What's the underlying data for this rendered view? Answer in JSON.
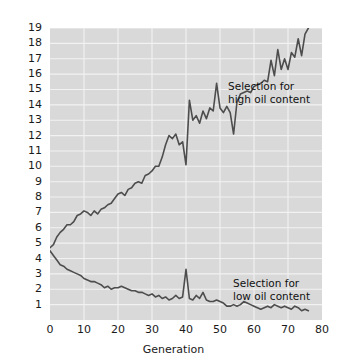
{
  "chart_data": {
    "type": "line",
    "title": "",
    "subtitle": "",
    "xlabel": "Generation",
    "ylabel": "Percentage of oil content",
    "xlim": [
      0,
      80
    ],
    "ylim": [
      0,
      19
    ],
    "xticks": [
      0,
      10,
      20,
      30,
      40,
      50,
      60,
      70,
      80
    ],
    "yticks": [
      1,
      2,
      3,
      4,
      5,
      6,
      7,
      8,
      9,
      10,
      11,
      12,
      13,
      14,
      15,
      16,
      17,
      18,
      19
    ],
    "grid": true,
    "grid_color": "#f2f2f2",
    "plot_background": "#d9d9d9",
    "line_color": "#4d4d4d",
    "legend": "none",
    "annotations": [
      {
        "name": "high-selection-label",
        "text": "Selection for\nhigh oil content",
        "x": 48,
        "y": 17.2
      },
      {
        "name": "low-selection-label",
        "text": "Selection for\nlow oil content",
        "x": 49,
        "y": 4.2
      }
    ],
    "series": [
      {
        "name": "Selection for high oil content",
        "color": "#4d4d4d",
        "x": [
          0,
          1,
          2,
          3,
          4,
          5,
          6,
          7,
          8,
          9,
          10,
          11,
          12,
          13,
          14,
          15,
          16,
          17,
          18,
          19,
          20,
          21,
          22,
          23,
          24,
          25,
          26,
          27,
          28,
          29,
          30,
          31,
          32,
          33,
          34,
          35,
          36,
          37,
          38,
          39,
          40,
          41,
          42,
          43,
          44,
          45,
          46,
          47,
          48,
          49,
          50,
          51,
          52,
          53,
          54,
          55,
          56,
          57,
          58,
          59,
          60,
          61,
          62,
          63,
          64,
          65,
          66,
          67,
          68,
          69,
          70,
          71,
          72,
          73,
          74,
          75,
          76
        ],
        "values": [
          4.7,
          4.9,
          5.4,
          5.7,
          5.9,
          6.2,
          6.2,
          6.4,
          6.8,
          6.9,
          7.1,
          7.0,
          6.8,
          7.1,
          6.9,
          7.2,
          7.3,
          7.5,
          7.6,
          7.9,
          8.2,
          8.3,
          8.1,
          8.5,
          8.6,
          8.9,
          9.0,
          8.9,
          9.4,
          9.5,
          9.7,
          10.0,
          10.0,
          10.6,
          11.4,
          12.0,
          11.8,
          12.1,
          11.4,
          11.6,
          10.1,
          14.3,
          13.0,
          13.3,
          12.8,
          13.6,
          13.1,
          13.8,
          13.6,
          15.4,
          13.8,
          13.5,
          13.9,
          13.5,
          12.1,
          14.2,
          14.7,
          14.8,
          14.9,
          14.8,
          15.2,
          15.3,
          15.4,
          15.6,
          15.5,
          16.9,
          15.9,
          17.6,
          16.3,
          17.0,
          16.3,
          17.4,
          17.1,
          18.3,
          17.2,
          18.6,
          19.0
        ]
      },
      {
        "name": "Selection for low oil content",
        "color": "#4d4d4d",
        "x": [
          0,
          1,
          2,
          3,
          4,
          5,
          6,
          7,
          8,
          9,
          10,
          11,
          12,
          13,
          14,
          15,
          16,
          17,
          18,
          19,
          20,
          21,
          22,
          23,
          24,
          25,
          26,
          27,
          28,
          29,
          30,
          31,
          32,
          33,
          34,
          35,
          36,
          37,
          38,
          39,
          40,
          41,
          42,
          43,
          44,
          45,
          46,
          47,
          48,
          49,
          50,
          51,
          52,
          53,
          54,
          55,
          56,
          57,
          58,
          59,
          60,
          61,
          62,
          63,
          64,
          65,
          66,
          67,
          68,
          69,
          70,
          71,
          72,
          73,
          74,
          75,
          76
        ],
        "values": [
          4.5,
          4.2,
          3.9,
          3.6,
          3.5,
          3.3,
          3.2,
          3.1,
          3.0,
          2.9,
          2.7,
          2.6,
          2.5,
          2.5,
          2.4,
          2.3,
          2.1,
          2.2,
          2.0,
          2.1,
          2.1,
          2.2,
          2.1,
          2.0,
          1.9,
          1.9,
          1.8,
          1.8,
          1.7,
          1.6,
          1.7,
          1.5,
          1.6,
          1.4,
          1.5,
          1.3,
          1.4,
          1.6,
          1.4,
          1.5,
          3.3,
          1.4,
          1.3,
          1.6,
          1.4,
          1.8,
          1.3,
          1.2,
          1.2,
          1.3,
          1.2,
          1.1,
          0.9,
          0.9,
          1.0,
          0.9,
          1.0,
          1.2,
          1.1,
          1.0,
          0.9,
          0.8,
          0.7,
          0.8,
          0.9,
          0.8,
          1.0,
          0.9,
          0.8,
          0.9,
          0.8,
          0.7,
          0.9,
          0.8,
          0.6,
          0.7,
          0.6
        ]
      }
    ]
  }
}
